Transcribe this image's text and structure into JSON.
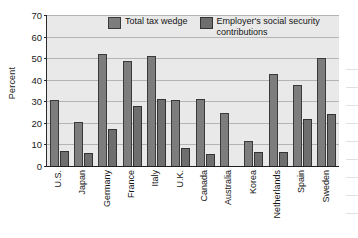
{
  "chart_data": {
    "type": "bar",
    "title": "",
    "xlabel": "",
    "ylabel": "Percent",
    "ylim": [
      0,
      70
    ],
    "yticks": [
      0,
      10,
      20,
      30,
      40,
      50,
      60,
      70
    ],
    "grid": true,
    "legend_position": "top-center",
    "categories": [
      "U.S.",
      "Japan",
      "Germany",
      "France",
      "Italy",
      "U.K.",
      "Canada",
      "Australia",
      "Korea",
      "Netherlands",
      "Spain",
      "Sweden"
    ],
    "series": [
      {
        "name": "Total tax wedge",
        "color": "#7d7d7d",
        "values": [
          30.5,
          20.5,
          52,
          48.5,
          51,
          30.5,
          31,
          24.5,
          11.5,
          42.5,
          37.5,
          50
        ]
      },
      {
        "name": "Employer's social security contributions",
        "color": "#6e6e6e",
        "values": [
          7,
          6,
          17,
          28,
          31,
          8.5,
          5.5,
          null,
          6.5,
          6.5,
          22,
          24
        ]
      }
    ]
  },
  "axis": {
    "y_label": "Percent",
    "y_tick_labels": [
      "70",
      "60",
      "50",
      "40",
      "30",
      "20",
      "10",
      "0"
    ]
  },
  "legend": {
    "items": [
      {
        "label": "Total tax wedge",
        "swatch": "series-1-swatch"
      },
      {
        "label": "Employer's social security contributions",
        "swatch": "series-2-swatch"
      }
    ]
  }
}
